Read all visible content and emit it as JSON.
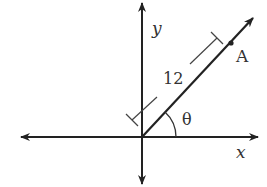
{
  "diagram": {
    "axes": {
      "x_label": "x",
      "y_label": "y"
    },
    "ray": {
      "point_label": "A",
      "length_label": "12",
      "angle_label": "θ"
    },
    "colors": {
      "stroke": "#222222",
      "text": "#333333",
      "background": "#ffffff"
    }
  }
}
